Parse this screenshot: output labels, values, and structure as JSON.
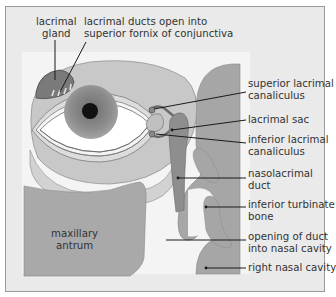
{
  "diagram": {
    "colors": {
      "background": "#eaeaea",
      "panel": "#f2f2f2",
      "light_tissue": "#c8c8c8",
      "mid_tissue": "#a9a9a9",
      "dark_tissue": "#8e8e8e",
      "iris": "#8a8a8a",
      "pupil": "#111111",
      "line": "#1a1a1a"
    },
    "labels": {
      "lacrimal_gland": "lacrimal\ngland",
      "lacrimal_ducts": "lacrimal ducts open into\nsuperior fornix of conjunctiva",
      "superior_canaliculus": "superior lacrimal\ncanaliculus",
      "lacrimal_sac": "lacrimal sac",
      "inferior_canaliculus": "inferior lacrimal\ncanaliculus",
      "nasolacrimal_duct": "nasolacrimal\nduct",
      "inferior_turbinate": "inferior turbinate\nbone",
      "duct_opening": "opening of duct\ninto nasal cavity",
      "nasal_cavity": "right nasal cavity",
      "maxillary_antrum": "maxillary\nantrum"
    }
  }
}
